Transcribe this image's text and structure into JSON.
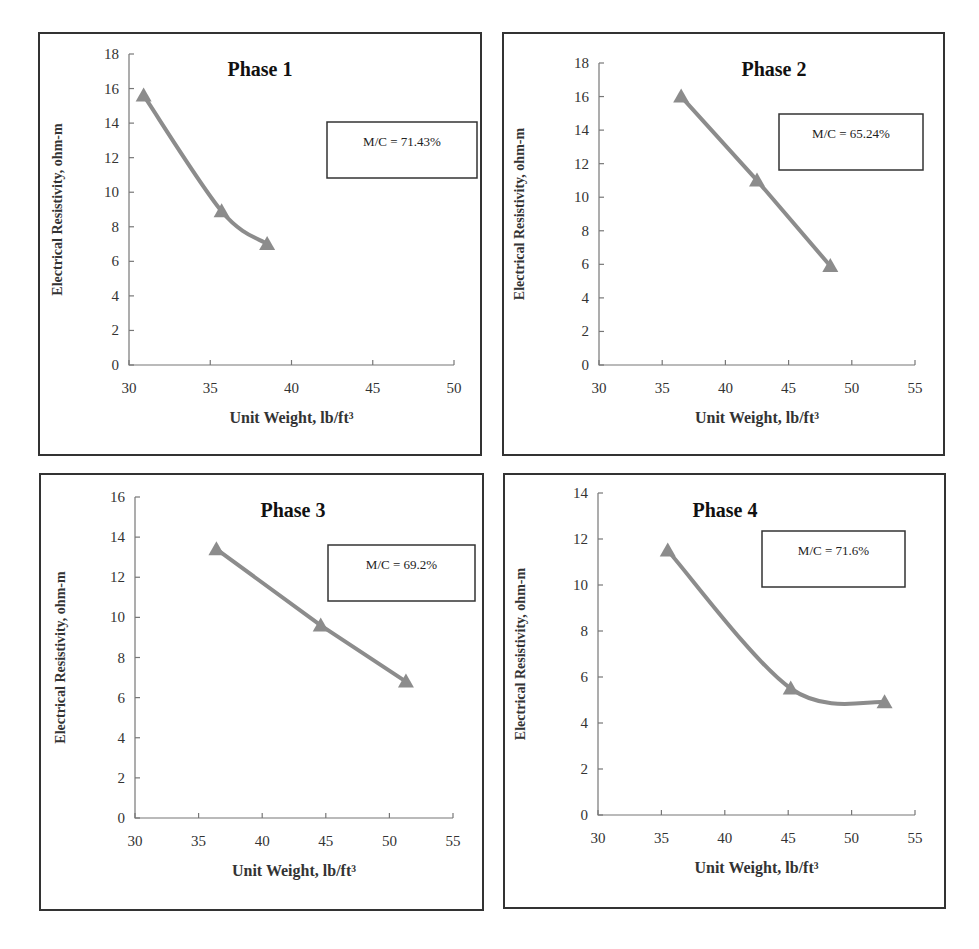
{
  "chart_data": [
    {
      "type": "line",
      "title": "Phase 1",
      "xlabel": "Unit Weight, lb/ft³",
      "ylabel": "Electrical Resistivity, ohm-m",
      "annotation": "M/C = 71.43%",
      "xlim": [
        30,
        50
      ],
      "ylim": [
        0,
        18
      ],
      "xticks": [
        30,
        35,
        40,
        45,
        50
      ],
      "yticks": [
        0,
        2,
        4,
        6,
        8,
        10,
        12,
        14,
        16,
        18
      ],
      "smooth": true,
      "marker": "triangle",
      "grid": false,
      "series": [
        {
          "name": "Phase 1",
          "x": [
            30.9,
            35.7,
            38.5
          ],
          "y": [
            15.6,
            8.9,
            7.0
          ]
        }
      ]
    },
    {
      "type": "line",
      "title": "Phase 2",
      "xlabel": "Unit Weight, lb/ft³",
      "ylabel": "Electrical Resistivity, ohm-m",
      "annotation": "M/C = 65.24%",
      "xlim": [
        30,
        55
      ],
      "ylim": [
        0,
        18
      ],
      "xticks": [
        30,
        35,
        40,
        45,
        50,
        55
      ],
      "yticks": [
        0,
        2,
        4,
        6,
        8,
        10,
        12,
        14,
        16,
        18
      ],
      "smooth": false,
      "marker": "triangle",
      "grid": false,
      "series": [
        {
          "name": "Phase 2",
          "x": [
            36.5,
            42.5,
            48.3
          ],
          "y": [
            16.0,
            11.0,
            5.9
          ]
        }
      ]
    },
    {
      "type": "line",
      "title": "Phase 3",
      "xlabel": "Unit Weight, lb/ft³",
      "ylabel": "Electrical Resistivity, ohm-m",
      "annotation": "M/C = 69.2%",
      "xlim": [
        30,
        55
      ],
      "ylim": [
        0,
        16
      ],
      "xticks": [
        30,
        35,
        40,
        45,
        50,
        55
      ],
      "yticks": [
        0,
        2,
        4,
        6,
        8,
        10,
        12,
        14,
        16
      ],
      "smooth": false,
      "marker": "triangle",
      "grid": false,
      "series": [
        {
          "name": "Phase 3",
          "x": [
            36.4,
            44.6,
            51.3
          ],
          "y": [
            13.4,
            9.6,
            6.8
          ]
        }
      ]
    },
    {
      "type": "line",
      "title": "Phase 4",
      "xlabel": "Unit Weight, lb/ft³",
      "ylabel": "Electrical Resistivity, ohm-m",
      "annotation": "M/C = 71.6%",
      "xlim": [
        30,
        55
      ],
      "ylim": [
        0,
        14
      ],
      "xticks": [
        30,
        35,
        40,
        45,
        50,
        55
      ],
      "yticks": [
        0,
        2,
        4,
        6,
        8,
        10,
        12,
        14
      ],
      "smooth": true,
      "marker": "triangle",
      "grid": false,
      "series": [
        {
          "name": "Phase 4",
          "x": [
            35.5,
            45.2,
            52.6
          ],
          "y": [
            11.5,
            5.5,
            4.9
          ]
        }
      ]
    }
  ],
  "layout": [
    {
      "box": [
        38,
        32,
        444,
        424
      ],
      "plot": [
        89,
        20,
        325,
        311
      ],
      "title_xy": [
        220,
        42
      ],
      "ann_box": [
        287,
        88,
        150,
        56
      ],
      "ylabel_x": 22
    },
    {
      "box": [
        502,
        32,
        443,
        424
      ],
      "plot": [
        95,
        29,
        316,
        302
      ],
      "title_xy": [
        270,
        42
      ],
      "ann_box": [
        275,
        80,
        144,
        56
      ],
      "ylabel_x": 20
    },
    {
      "box": [
        39,
        473,
        445,
        438
      ],
      "plot": [
        94,
        22,
        318,
        321
      ],
      "title_xy": [
        252,
        42
      ],
      "ann_box": [
        287,
        70,
        147,
        56
      ],
      "ylabel_x": 24
    },
    {
      "box": [
        503,
        473,
        443,
        436
      ],
      "plot": [
        93,
        18,
        317,
        322
      ],
      "title_xy": [
        220,
        42
      ],
      "ann_box": [
        257,
        56,
        143,
        56
      ],
      "ylabel_x": 20
    }
  ],
  "colors": {
    "series": "#8c8c8c",
    "axis": "#777777",
    "frame": "#333333"
  }
}
